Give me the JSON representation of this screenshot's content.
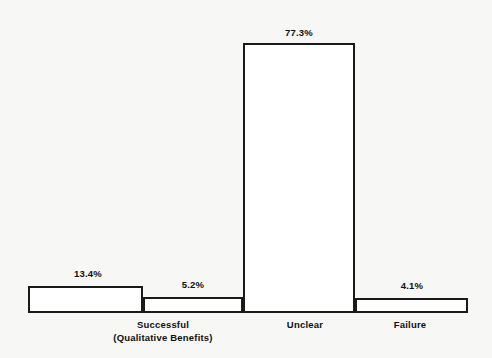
{
  "chart_data": {
    "type": "bar",
    "title": "",
    "subtitle": "",
    "xlabel": "",
    "ylabel": "",
    "ylim": [
      0,
      80
    ],
    "grid": false,
    "legend": false,
    "legend_position": "none",
    "orientation": "vertical",
    "categories": [
      "Successful\n(Qualitative Benefits)",
      "",
      "Unclear",
      "Failure"
    ],
    "values": [
      13.4,
      5.2,
      77.3,
      4.1
    ],
    "data_labels": [
      "13.4%",
      "5.2%",
      "77.3%",
      "4.1%"
    ],
    "bars": [
      {
        "id": "bar-successful",
        "value": 13.4,
        "data_label": "13.4%",
        "category_label_line1": "Successful",
        "category_label_line2": "(Qualitative Benefits)",
        "geometry": {
          "left": 28,
          "right": 143,
          "top": 286,
          "bottom": 313
        },
        "label_center_x": 88,
        "label_top": 268
      },
      {
        "id": "bar-successful-secondary",
        "value": 5.2,
        "data_label": "5.2%",
        "category_label_line1": "",
        "category_label_line2": "",
        "geometry": {
          "left": 143,
          "right": 243,
          "top": 297,
          "bottom": 313
        },
        "label_center_x": 193,
        "label_top": 279
      },
      {
        "id": "bar-unclear",
        "value": 77.3,
        "data_label": "77.3%",
        "category_label_line1": "Unclear",
        "category_label_line2": "",
        "geometry": {
          "left": 243,
          "right": 355,
          "top": 43,
          "bottom": 313
        },
        "label_center_x": 299,
        "label_top": 27
      },
      {
        "id": "bar-failure",
        "value": 4.1,
        "data_label": "4.1%",
        "category_label_line1": "Failure",
        "category_label_line2": "",
        "geometry": {
          "left": 355,
          "right": 468,
          "top": 298,
          "bottom": 313
        },
        "label_center_x": 412,
        "label_top": 280
      }
    ],
    "category_label_positions": [
      {
        "center_x": 163,
        "top": 318
      },
      {
        "center_x": 305,
        "top": 318
      },
      {
        "center_x": 410,
        "top": 318
      }
    ]
  },
  "style": {
    "background_color": "#f7f7f6",
    "bar_fill_color": "#ffffff",
    "bar_border_color": "#1a1a1a",
    "text_color": "#101010"
  },
  "labels": {
    "value_1": "13.4%",
    "value_2": "5.2%",
    "value_3": "77.3%",
    "value_4": "4.1%",
    "category_1_line1": "Successful",
    "category_1_line2": "(Qualitative Benefits)",
    "category_2": "Unclear",
    "category_3": "Failure"
  }
}
